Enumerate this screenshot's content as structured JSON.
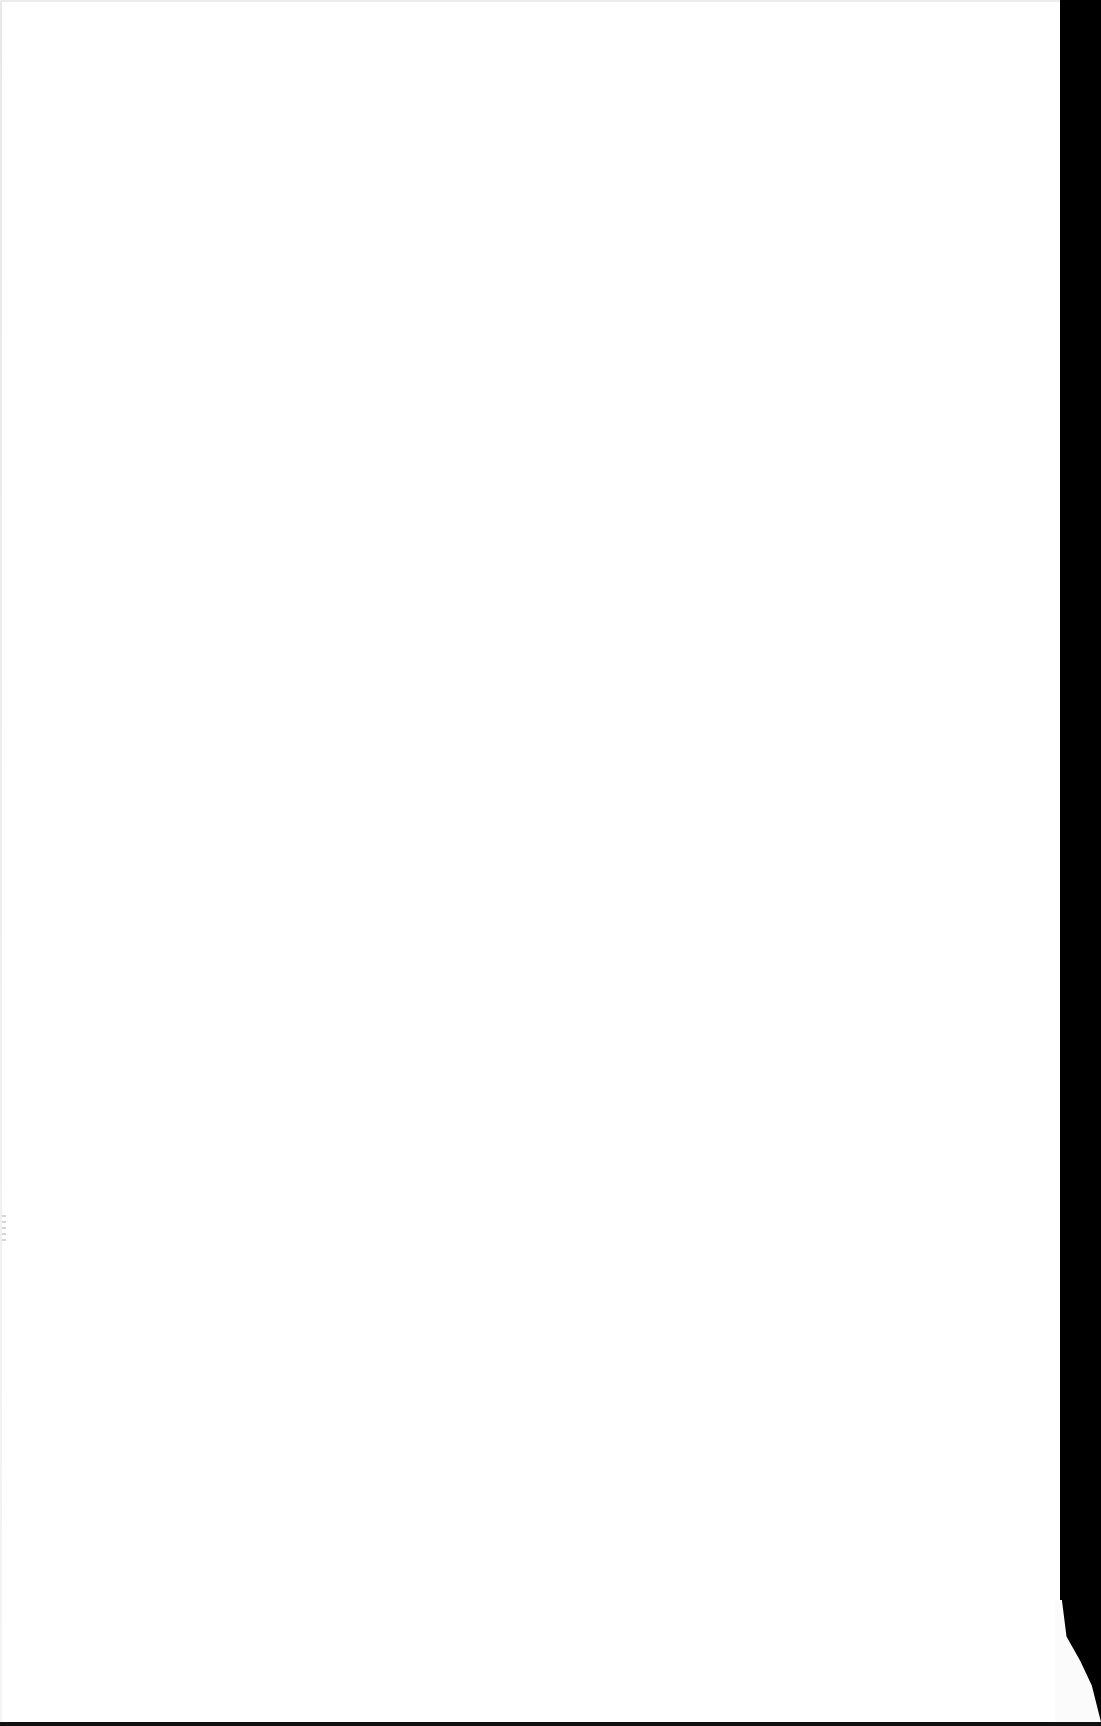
{
  "document": {
    "type": "scanned-page",
    "content": "",
    "colors": {
      "paper": "#ffffff",
      "scanner_background": "#000000"
    }
  }
}
